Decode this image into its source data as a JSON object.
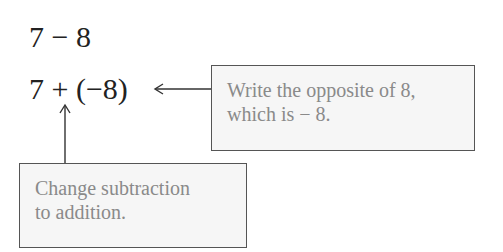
{
  "expressions": {
    "line1": "7 − 8",
    "line2": "7 + (−8)"
  },
  "callouts": [
    {
      "text": "Write the opposite of 8,\nwhich is − 8.",
      "target": "(−8)"
    },
    {
      "text": "Change subtraction\nto addition.",
      "target": "+"
    }
  ],
  "colors": {
    "box_fill": "#f6f6f6",
    "box_border": "#555555",
    "callout_text": "#8a8a8a",
    "math_text": "#222222"
  }
}
